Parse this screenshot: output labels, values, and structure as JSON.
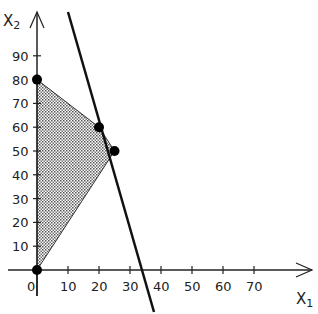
{
  "chart_data": {
    "type": "line",
    "title": "",
    "xlabel": "X1",
    "ylabel": "X2",
    "xlabel_main": "X",
    "xlabel_sub": "1",
    "ylabel_main": "X",
    "ylabel_sub": "2",
    "xlim": [
      -10,
      85
    ],
    "ylim": [
      0,
      110
    ],
    "x_ticks": [
      0,
      10,
      20,
      30,
      40,
      50,
      60,
      70
    ],
    "x_tick_labels": [
      "0",
      "10",
      "20",
      "30",
      "40",
      "50",
      "60",
      "70"
    ],
    "y_ticks": [
      10,
      20,
      30,
      40,
      50,
      60,
      70,
      80,
      90
    ],
    "y_tick_labels": [
      "10",
      "20",
      "30",
      "40",
      "50",
      "60",
      "70",
      "80",
      "90"
    ],
    "grid": false,
    "feasible_region": {
      "vertices": [
        [
          0,
          0
        ],
        [
          0,
          80
        ],
        [
          20,
          60
        ],
        [
          25,
          50
        ]
      ],
      "fill": "dotted-gray"
    },
    "constraint_line": {
      "points": [
        [
          10.5,
          110
        ],
        [
          38,
          0
        ]
      ],
      "description": "steep decreasing line crossing the x-axis near 38"
    },
    "points": [
      {
        "x": 0,
        "y": 0
      },
      {
        "x": 0,
        "y": 80
      },
      {
        "x": 20,
        "y": 60
      },
      {
        "x": 25,
        "y": 50
      }
    ]
  }
}
